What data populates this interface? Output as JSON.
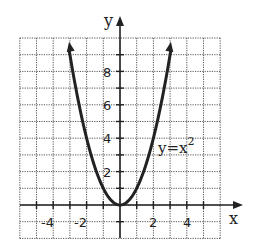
{
  "chart_data": {
    "type": "line",
    "title": "",
    "xlabel": "x",
    "ylabel": "y",
    "xlim": [
      -6,
      6
    ],
    "ylim": [
      -2,
      10
    ],
    "grid": true,
    "x_ticks": [
      -4,
      -2,
      2,
      4
    ],
    "y_ticks": [
      2,
      4,
      6,
      8
    ],
    "series": [
      {
        "name": "y=x^2",
        "x": [
          -3.2,
          -3,
          -2.5,
          -2,
          -1.5,
          -1,
          -0.5,
          0,
          0.5,
          1,
          1.5,
          2,
          2.5,
          3,
          3.2
        ],
        "y": [
          10.24,
          9,
          6.25,
          4,
          2.25,
          1,
          0.25,
          0,
          0.25,
          1,
          2.25,
          4,
          6.25,
          9,
          10.24
        ]
      }
    ],
    "annotations": [
      {
        "text": "y=x",
        "superscript": "2",
        "x": 2.3,
        "y": 4
      }
    ]
  },
  "labels": {
    "x_axis": "x",
    "y_axis": "y",
    "curve_label": "y=x",
    "curve_label_sup": "2",
    "xt_m4": "-4",
    "xt_m2": "-2",
    "xt_2": "2",
    "xt_4": "4",
    "yt_2": "2",
    "yt_4": "4",
    "yt_6": "6",
    "yt_8": "8"
  }
}
